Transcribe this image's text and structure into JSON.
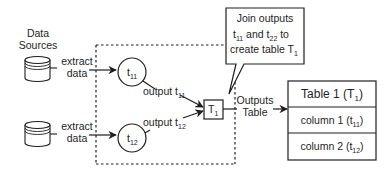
{
  "diagram": {
    "data_sources_label_line1": "Data",
    "data_sources_label_line2": "Sources",
    "source1": {
      "edge_label_line1": "extract",
      "edge_label_line2": "data"
    },
    "source2": {
      "edge_label_line1": "extract",
      "edge_label_line2": "data"
    },
    "node_t11": {
      "base": "t",
      "sub": "11"
    },
    "node_t12": {
      "base": "t",
      "sub": "12"
    },
    "edge_t11": {
      "base": "output t",
      "sub": "11"
    },
    "edge_t12": {
      "base": "output t",
      "sub": "12"
    },
    "node_T1": {
      "base": "T",
      "sub": "1"
    },
    "callout": {
      "line1": "Join outputs",
      "line2_a": "t",
      "line2_a_sub": "11",
      "line2_mid": " and t",
      "line2_b_sub": "22",
      "line2_end": " to",
      "line3": "create table T",
      "line3_sub": "1"
    },
    "output_edge_line1": "Outputs",
    "output_edge_line2": "Table",
    "table": {
      "title": "Table 1 (T",
      "title_sub": "1",
      "title_end": ")",
      "rows": [
        {
          "label": "column 1 (t",
          "sub": "11",
          "end": ")"
        },
        {
          "label": "column 2 (t",
          "sub": "12",
          "end": ")"
        }
      ]
    },
    "colors": {
      "stroke": "#1e1e1e",
      "background": "#ffffff"
    }
  }
}
